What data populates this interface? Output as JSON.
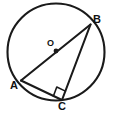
{
  "figure": {
    "type": "circle-geometry",
    "background_color": "#ffffff",
    "stroke_color": "#1a1a1a",
    "label_color": "#111111"
  },
  "circle": {
    "name": "main-circle",
    "center_x": 56,
    "center_y": 52,
    "radius": 48.5,
    "stroke_width": 2.1
  },
  "center_point": {
    "label": "O",
    "x": 56,
    "y": 51,
    "dot_radius": 2.4
  },
  "points": [
    {
      "id": "A",
      "label": "A",
      "x": 21,
      "y": 80.5
    },
    {
      "id": "B",
      "label": "B",
      "x": 90.5,
      "y": 24.5
    },
    {
      "id": "C",
      "label": "C",
      "x": 62,
      "y": 100
    }
  ],
  "segments": [
    {
      "id": "AB",
      "from": "A",
      "to": "B",
      "kind": "diameter",
      "stroke_width": 2.1
    },
    {
      "id": "AC",
      "from": "A",
      "to": "C",
      "kind": "chord",
      "stroke_width": 2.1
    },
    {
      "id": "CB",
      "from": "C",
      "to": "B",
      "kind": "chord",
      "stroke_width": 2.1
    }
  ],
  "right_angle_mark": {
    "name": "right-angle-mark-at-C",
    "at_point": "C",
    "size": 9.5,
    "stroke_width": 1.6
  }
}
